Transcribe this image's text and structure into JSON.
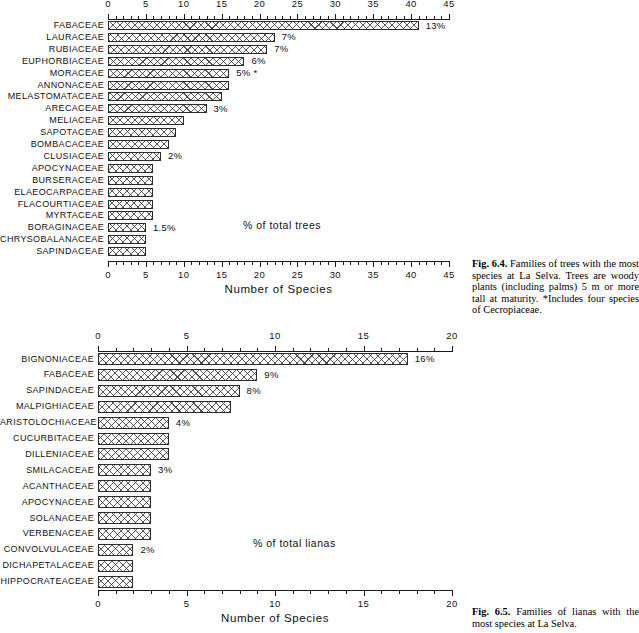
{
  "chart_data": [
    {
      "type": "bar",
      "orientation": "horizontal",
      "id": "trees",
      "title": "",
      "xlabel": "Number of Species",
      "ylabel": "",
      "xlim": [
        0,
        45
      ],
      "xticks": [
        0,
        5,
        10,
        15,
        20,
        25,
        30,
        35,
        40,
        45
      ],
      "xticklabels": [
        "0",
        "5",
        "10",
        "15",
        "20",
        "25",
        "30",
        "35",
        "40",
        "45"
      ],
      "grid": false,
      "annotation": "% of total trees",
      "categories": [
        "FABACEAE",
        "LAURACEAE",
        "RUBIACEAE",
        "EUPHORBIACEAE",
        "MORACEAE",
        "ANNONACEAE",
        "MELASTOMATACEAE",
        "ARECACEAE",
        "MELIACEAE",
        "SAPOTACEAE",
        "BOMBACACEAE",
        "CLUSIACEAE",
        "APOCYNACEAE",
        "BURSERACEAE",
        "ELAEOCARPACEAE",
        "FLACOURTIACEAE",
        "MYRTACEAE",
        "BORAGINACEAE",
        "CHRYSOBALANACEAE",
        "SAPINDACEAE"
      ],
      "values": [
        41,
        22,
        21,
        18,
        16,
        16,
        15,
        13,
        10,
        9,
        8,
        7,
        6,
        6,
        6,
        6,
        6,
        5,
        5,
        5
      ],
      "point_labels": [
        "13%",
        "7%",
        "7%",
        "6%",
        "5% *",
        "",
        "",
        "3%",
        "",
        "",
        "",
        "2%",
        "",
        "",
        "",
        "",
        "",
        "1.5%",
        "",
        ""
      ]
    },
    {
      "type": "bar",
      "orientation": "horizontal",
      "id": "lianas",
      "title": "",
      "xlabel": "Number of Species",
      "ylabel": "",
      "xlim": [
        0,
        20
      ],
      "xticks": [
        0,
        5,
        10,
        15,
        20
      ],
      "xticklabels": [
        "0",
        "5",
        "10",
        "15",
        "20"
      ],
      "grid": false,
      "annotation": "% of total lianas",
      "categories": [
        "BIGNONIACEAE",
        "FABACEAE",
        "SAPINDACEAE",
        "MALPIGHIACEAE",
        "ARISTOLOCHIACEAE",
        "CUCURBITACEAE",
        "DILLENIACEAE",
        "SMILACACEAE",
        "ACANTHACEAE",
        "APOCYNACEAE",
        "SOLANACEAE",
        "VERBENACEAE",
        "CONVOLVULACEAE",
        "DICHAPETALACEAE",
        "HIPPOCRATEACEAE"
      ],
      "values": [
        17.5,
        9,
        8,
        7.5,
        4,
        4,
        4,
        3,
        3,
        3,
        3,
        3,
        2,
        2,
        2
      ],
      "point_labels": [
        "16%",
        "9%",
        "8%",
        "",
        "4%",
        "",
        "",
        "3%",
        "",
        "",
        "",
        "",
        "2%",
        "",
        ""
      ]
    }
  ],
  "captions": {
    "fig_6_4": {
      "label": "Fig. 6.4.",
      "text": " Families of trees with the most species at La Selva. Trees are woody plants (including palms) 5 m or more tall at maturity. *Includes four species of Cecropiaceae."
    },
    "fig_6_5": {
      "label": "Fig. 6.5.",
      "text": " Families of lianas with the most species at La Selva."
    }
  }
}
